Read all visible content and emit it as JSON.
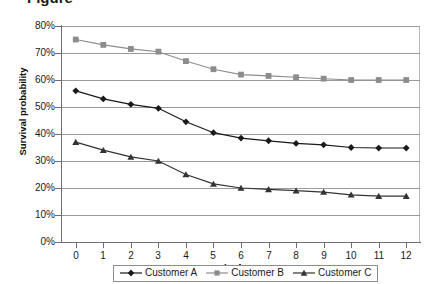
{
  "caption_fragment": "Figure",
  "chart_data": {
    "type": "line",
    "title": "",
    "xlabel": "Months from now",
    "ylabel": "Survival probability",
    "x": [
      0,
      1,
      2,
      3,
      4,
      5,
      6,
      7,
      8,
      9,
      10,
      11,
      12
    ],
    "xtick_labels": [
      "0",
      "1",
      "2",
      "3",
      "4",
      "5",
      "6",
      "7",
      "8",
      "9",
      "10",
      "11",
      "12"
    ],
    "ytick_labels": [
      "0%",
      "10%",
      "20%",
      "30%",
      "40%",
      "50%",
      "60%",
      "70%",
      "80%"
    ],
    "ytick_values": [
      0,
      10,
      20,
      30,
      40,
      50,
      60,
      70,
      80
    ],
    "ylim": [
      0,
      80
    ],
    "xlim": [
      -0.5,
      12.5
    ],
    "grid": "horizontal",
    "legend_position": "bottom",
    "value_unit": "percent",
    "series": [
      {
        "name": "Customer A",
        "color": "#1a1a1a",
        "marker": "diamond",
        "values": [
          56,
          53,
          51,
          49.5,
          44.5,
          40.5,
          38.5,
          37.5,
          36.5,
          36,
          35,
          34.8,
          34.8
        ]
      },
      {
        "name": "Customer B",
        "color": "#8c8c8c",
        "marker": "square",
        "values": [
          75,
          73,
          71.5,
          70.5,
          67,
          64,
          62,
          61.5,
          61,
          60.5,
          60,
          60,
          60
        ]
      },
      {
        "name": "Customer C",
        "color": "#333333",
        "marker": "triangle",
        "values": [
          37,
          34,
          31.5,
          30,
          25,
          21.5,
          20,
          19.5,
          19,
          18.5,
          17.5,
          17,
          17
        ]
      }
    ]
  },
  "legend": {
    "items": [
      {
        "label": "Customer A"
      },
      {
        "label": "Customer B"
      },
      {
        "label": "Customer C"
      }
    ]
  },
  "colors": {
    "series_a": "#1a1a1a",
    "series_b": "#8c8c8c",
    "series_c": "#333333",
    "gridline": "#9a9a9a",
    "axis": "#6e6e6e",
    "plot_border": "#b9b9b9",
    "background": "#ffffff",
    "text": "#1a1a1a"
  }
}
